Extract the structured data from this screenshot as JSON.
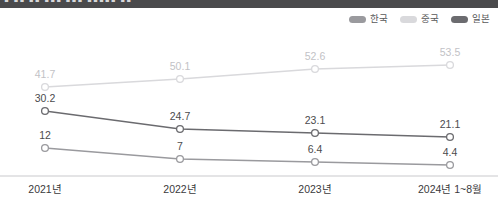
{
  "header": {
    "glyph_text": "▮ ▮▮ ▮▮ ▮▮▮  ▮▮▮ ▮▮▮▮▮ ▮▮"
  },
  "legend": {
    "position": "top-right",
    "items": [
      {
        "label": "한국",
        "color": "#9a9a9e",
        "icon": "line-swatch-icon"
      },
      {
        "label": "중국",
        "color": "#d9d9dc",
        "icon": "line-swatch-icon"
      },
      {
        "label": "일본",
        "color": "#6b6b6f",
        "icon": "line-swatch-icon"
      }
    ]
  },
  "chart_data": {
    "type": "line",
    "title": "",
    "subtitle": "",
    "xlabel": "",
    "ylabel": "",
    "grid": false,
    "legend_position": "top-right",
    "axis": {
      "x_axis_visible": true,
      "y_axis_visible": false
    },
    "ylim": [
      0,
      60
    ],
    "categories": [
      "2021년",
      "2022년",
      "2023년",
      "2024년 1~8월"
    ],
    "series": [
      {
        "name": "중국",
        "color": "#d9d9dc",
        "label_color": "#c2c2c6",
        "values": [
          41.7,
          50.1,
          52.6,
          53.5
        ],
        "labels": [
          "41.7",
          "50.1",
          "52.6",
          "53.5"
        ]
      },
      {
        "name": "일본",
        "color": "#6b6b6f",
        "label_color": "#4b4b4d",
        "values": [
          30.2,
          24.7,
          23.1,
          21.1
        ],
        "labels": [
          "30.2",
          "24.7",
          "23.1",
          "21.1"
        ]
      },
      {
        "name": "한국",
        "color": "#9a9a9e",
        "label_color": "#4b4b4d",
        "values": [
          12,
          7,
          6.4,
          4.4
        ],
        "labels": [
          "12",
          "7",
          "6.4",
          "4.4"
        ]
      }
    ]
  },
  "geometry": {
    "x_positions": [
      45,
      180,
      315,
      450
    ],
    "series_y": {
      "중국": [
        57,
        49,
        39,
        35
      ],
      "일본": [
        81,
        99,
        103,
        107
      ],
      "한국": [
        118,
        129,
        132,
        135
      ]
    },
    "label_dy": -9,
    "axis_y": 146,
    "x_label_y": 163
  }
}
